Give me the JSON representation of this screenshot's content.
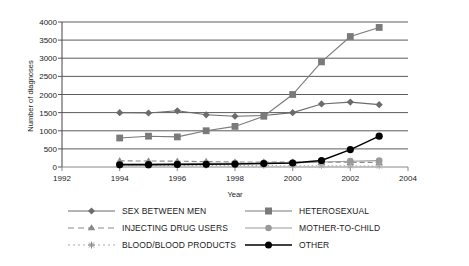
{
  "chart_data": {
    "type": "line",
    "title": "",
    "xlabel": "Year",
    "ylabel": "Number of diagnoses",
    "xlim": [
      1992,
      2004
    ],
    "ylim": [
      0,
      4000
    ],
    "ytick_step": 500,
    "xtick_step": 2,
    "grid": true,
    "legend_position": "bottom",
    "xticks": [
      "1992",
      "1994",
      "1996",
      "1998",
      "2000",
      "2002",
      "2004"
    ],
    "yticks": [
      "0",
      "500",
      "1000",
      "1500",
      "2000",
      "2500",
      "3000",
      "3500",
      "4000"
    ],
    "x": [
      1994,
      1995,
      1996,
      1997,
      1998,
      1999,
      2000,
      2001,
      2002,
      2003
    ],
    "series": [
      {
        "name": "SEX BETWEEN MEN",
        "marker": "diamond",
        "color": "#6b6b6b",
        "dash": "none",
        "values": [
          1500,
          1490,
          1550,
          1440,
          1400,
          1420,
          1500,
          1740,
          1790,
          1720
        ]
      },
      {
        "name": "HETEROSEXUAL",
        "marker": "square",
        "color": "#7a7a7a",
        "dash": "none",
        "values": [
          800,
          850,
          830,
          1000,
          1120,
          1400,
          2000,
          2900,
          3600,
          3850
        ]
      },
      {
        "name": "INJECTING DRUG USERS",
        "marker": "triangle",
        "color": "#8a8a8a",
        "dash": "dashed",
        "values": [
          170,
          165,
          160,
          150,
          140,
          140,
          135,
          130,
          130,
          125
        ]
      },
      {
        "name": "MOTHER-TO-CHILD",
        "marker": "circle",
        "color": "#9a9a9a",
        "dash": "none",
        "values": [
          90,
          90,
          95,
          100,
          105,
          110,
          115,
          140,
          160,
          175
        ]
      },
      {
        "name": "BLOOD/BLOOD PRODUCTS",
        "marker": "asterisk",
        "color": "#aaaaaa",
        "dash": "dotted",
        "values": [
          50,
          48,
          45,
          42,
          40,
          38,
          35,
          33,
          30,
          28
        ]
      },
      {
        "name": "OTHER",
        "marker": "circle-filled",
        "color": "#000000",
        "dash": "none",
        "values": [
          60,
          65,
          70,
          75,
          80,
          95,
          110,
          180,
          480,
          850
        ]
      }
    ]
  },
  "legend": {
    "entries": [
      {
        "label": "SEX BETWEEN MEN",
        "column": "left"
      },
      {
        "label": "INJECTING DRUG USERS",
        "column": "left"
      },
      {
        "label": "BLOOD/BLOOD PRODUCTS",
        "column": "left"
      },
      {
        "label": "HETEROSEXUAL",
        "column": "right"
      },
      {
        "label": "MOTHER-TO-CHILD",
        "column": "right"
      },
      {
        "label": "OTHER",
        "column": "right"
      }
    ]
  }
}
